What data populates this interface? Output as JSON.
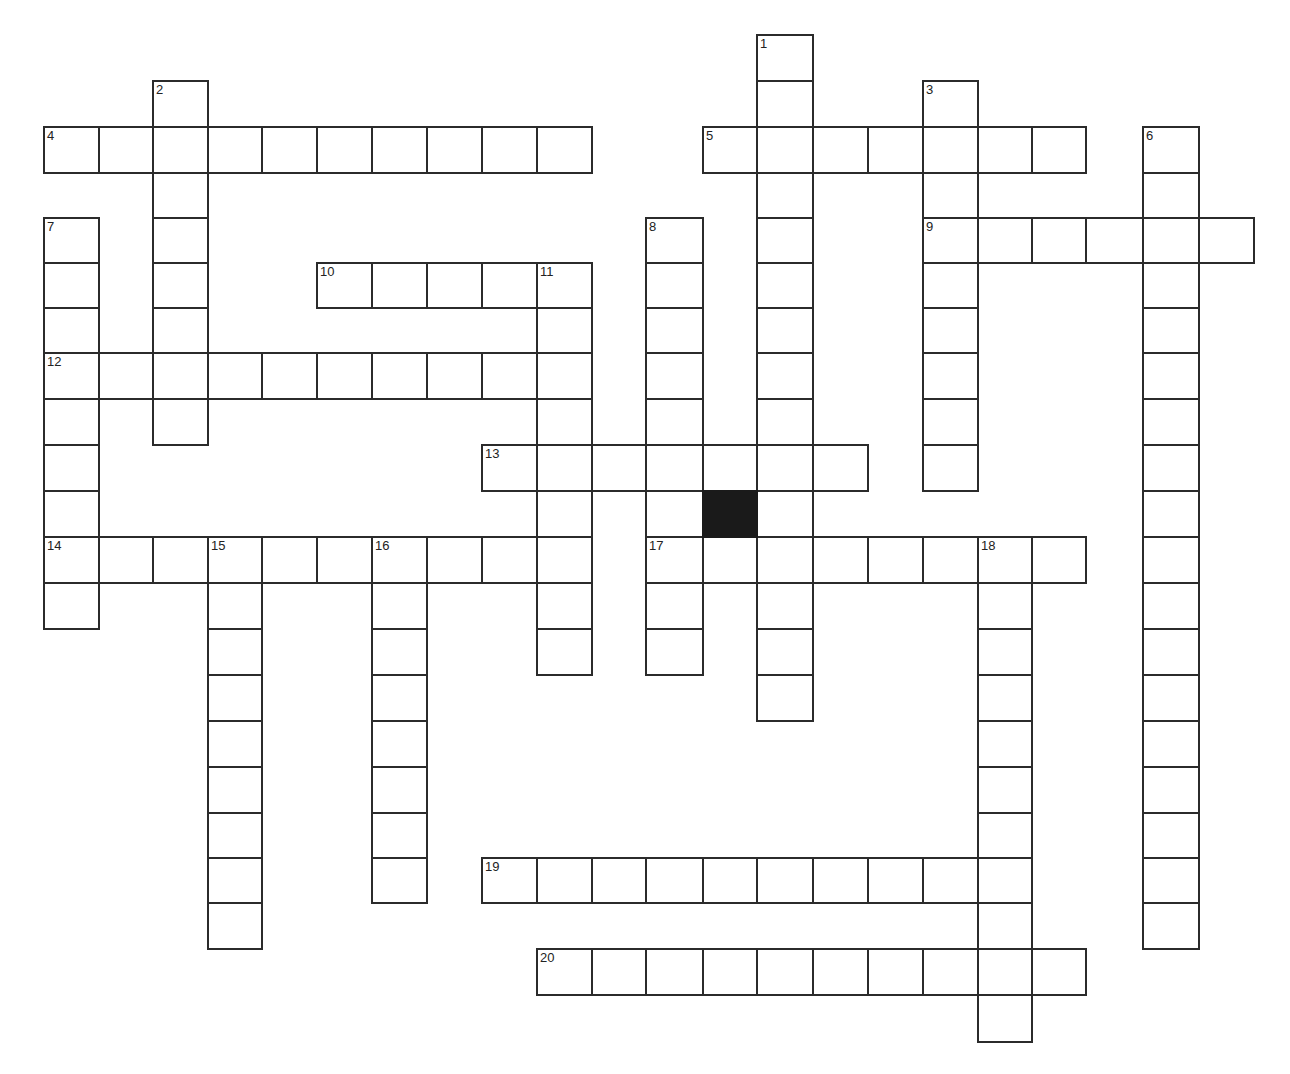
{
  "puzzle": {
    "type": "crossword",
    "colors": {
      "line": "#2b2b2b",
      "cell_fill": "#ffffff",
      "block_fill": "#1a1a1a",
      "number": "#222222"
    },
    "grid": {
      "col_x": [
        44,
        99,
        153,
        208,
        262,
        317,
        372,
        427,
        482,
        537,
        592,
        646,
        703,
        757,
        813,
        868,
        923,
        978,
        1032,
        1086,
        1143,
        1199,
        1254
      ],
      "row_y": [
        35,
        81,
        127,
        173,
        218,
        263,
        308,
        353,
        399,
        445,
        491,
        537,
        583,
        629,
        675,
        721,
        767,
        813,
        858,
        903,
        949,
        995,
        1042
      ],
      "cell_w": 55,
      "cell_h": 46
    },
    "words": [
      {
        "number": "1",
        "direction": "down",
        "col": 13,
        "row": 0,
        "length": 15
      },
      {
        "number": "2",
        "direction": "down",
        "col": 2,
        "row": 1,
        "length": 8
      },
      {
        "number": "3",
        "direction": "down",
        "col": 16,
        "row": 1,
        "length": 9
      },
      {
        "number": "4",
        "direction": "across",
        "col": 0,
        "row": 2,
        "length": 10
      },
      {
        "number": "5",
        "direction": "across",
        "col": 12,
        "row": 2,
        "length": 7
      },
      {
        "number": "6",
        "direction": "down",
        "col": 20,
        "row": 2,
        "length": 18
      },
      {
        "number": "7",
        "direction": "down",
        "col": 0,
        "row": 4,
        "length": 9
      },
      {
        "number": "8",
        "direction": "down",
        "col": 11,
        "row": 4,
        "length": 10
      },
      {
        "number": "9",
        "direction": "across",
        "col": 16,
        "row": 4,
        "length": 6
      },
      {
        "number": "10",
        "direction": "across",
        "col": 5,
        "row": 5,
        "length": 5
      },
      {
        "number": "11",
        "direction": "down",
        "col": 9,
        "row": 5,
        "length": 9
      },
      {
        "number": "12",
        "direction": "across",
        "col": 0,
        "row": 7,
        "length": 10
      },
      {
        "number": "13",
        "direction": "across",
        "col": 8,
        "row": 9,
        "length": 7
      },
      {
        "number": "14",
        "direction": "across",
        "col": 0,
        "row": 11,
        "length": 10
      },
      {
        "number": "15",
        "direction": "down",
        "col": 3,
        "row": 11,
        "length": 9
      },
      {
        "number": "16",
        "direction": "down",
        "col": 6,
        "row": 11,
        "length": 8
      },
      {
        "number": "17",
        "direction": "across",
        "col": 11,
        "row": 11,
        "length": 8
      },
      {
        "number": "18",
        "direction": "down",
        "col": 17,
        "row": 11,
        "length": 11
      },
      {
        "number": "19",
        "direction": "across",
        "col": 8,
        "row": 18,
        "length": 10
      },
      {
        "number": "20",
        "direction": "across",
        "col": 9,
        "row": 20,
        "length": 10
      }
    ],
    "blocks": [
      {
        "col": 12,
        "row": 10
      }
    ]
  }
}
